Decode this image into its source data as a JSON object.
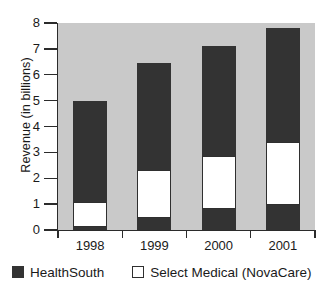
{
  "chart_data": {
    "type": "bar",
    "title": "",
    "xlabel": "",
    "ylabel": "Revenue (in billions)",
    "categories": [
      "1998",
      "1999",
      "2000",
      "2001"
    ],
    "ylim": [
      0,
      8
    ],
    "yticks": [
      0,
      1,
      2,
      3,
      4,
      5,
      6,
      7,
      8
    ],
    "ytick_labels": [
      "0",
      "1",
      "2",
      "3",
      "4",
      "5",
      "6",
      "7",
      "8"
    ],
    "grid": false,
    "stacked": true,
    "legend_position": "bottom",
    "series": [
      {
        "name": "HealthSouth",
        "color": "#333333",
        "swatch": "filled-square",
        "values": [
          4.0,
          4.6,
          5.05,
          5.35
        ],
        "base_values": [
          0.1,
          0.45,
          0.8,
          0.95
        ]
      },
      {
        "name": "Select Medical (NovaCare)",
        "color": "#ffffff",
        "swatch": "open-square",
        "values": [
          1.0,
          1.85,
          2.05,
          2.45
        ]
      }
    ],
    "bar_totals": [
      5.0,
      6.45,
      7.1,
      7.8
    ],
    "segments": [
      {
        "category": "1998",
        "bottom_dark": 0.1,
        "white_top": 1.1,
        "total": 5.0
      },
      {
        "category": "1999",
        "bottom_dark": 0.45,
        "white_top": 2.3,
        "total": 6.45
      },
      {
        "category": "2000",
        "bottom_dark": 0.8,
        "white_top": 2.85,
        "total": 7.1
      },
      {
        "category": "2001",
        "bottom_dark": 0.95,
        "white_top": 3.4,
        "total": 7.8
      }
    ],
    "colors": {
      "plot_background": "#c9c9c9",
      "page_background": "#ffffff",
      "dark_series": "#333333",
      "light_series": "#ffffff",
      "axis": "#2b2b2b"
    }
  },
  "axis": {
    "y_title": "Revenue (in billions)"
  },
  "legend": {
    "items": [
      {
        "label": "HealthSouth"
      },
      {
        "label": "Select Medical (NovaCare)"
      }
    ]
  }
}
